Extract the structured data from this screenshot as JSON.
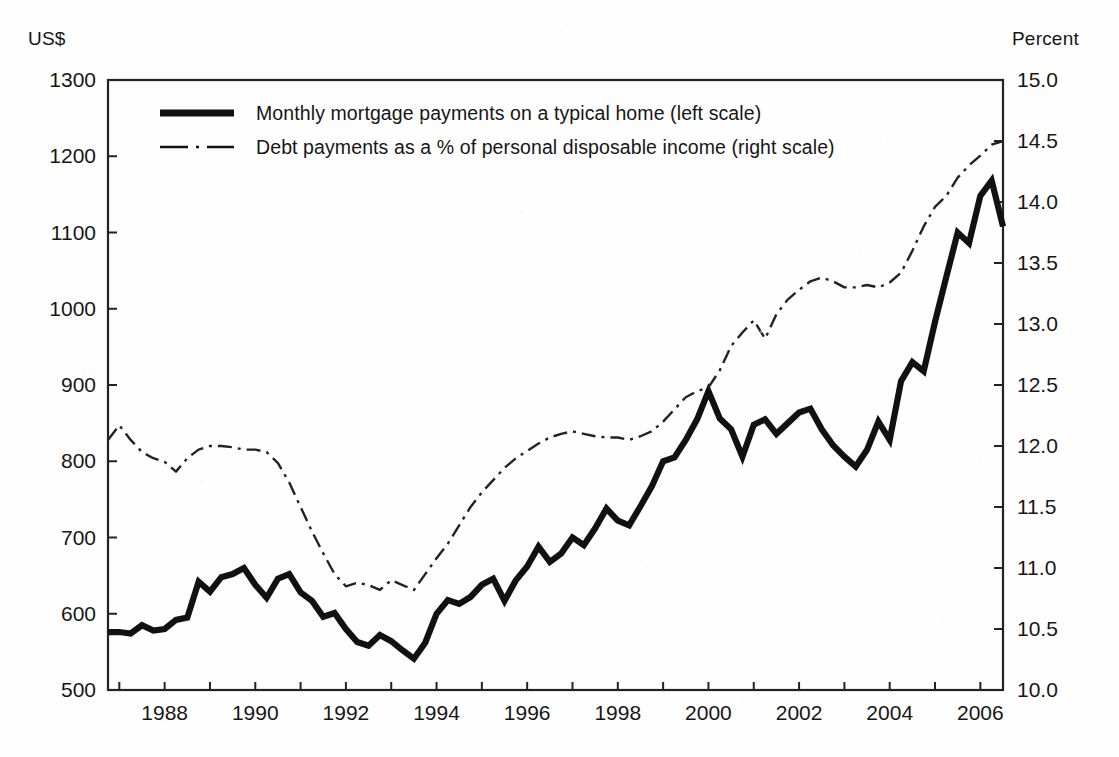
{
  "figure": {
    "background_color": "#fefefe",
    "ink_color": "#161616",
    "plot_box": {
      "left": 108,
      "top": 80,
      "right": 1003,
      "bottom": 690
    }
  },
  "left_axis": {
    "title": "US$",
    "ticks": [
      1300,
      1200,
      1100,
      1000,
      900,
      800,
      700,
      600,
      500
    ],
    "min": 500,
    "max": 1300
  },
  "right_axis": {
    "title": "Percent",
    "ticks": [
      "15.0",
      "14.5",
      "14.0",
      "13.5",
      "13.0",
      "12.5",
      "12.0",
      "11.5",
      "11.0",
      "10.5",
      "10.0"
    ],
    "min": 10.0,
    "max": 15.0
  },
  "x_axis": {
    "tick_labels": [
      "1988",
      "1990",
      "1992",
      "1994",
      "1996",
      "1998",
      "2000",
      "2002",
      "2004",
      "2006"
    ],
    "min": 1986.75,
    "max": 2006.5,
    "minor_tick_interval": 1
  },
  "legend": {
    "items": [
      {
        "label": "Monthly mortgage payments on a typical home (left scale)",
        "style": "solid-thick",
        "series": "mortgage_payments"
      },
      {
        "label": "Debt payments as a % of personal disposable income (right scale)",
        "style": "dash-dot-thin",
        "series": "debt_service_ratio"
      }
    ]
  },
  "chart_data": {
    "type": "line",
    "title": "",
    "xlabel": "",
    "ylabel": "US$",
    "y2label": "Percent",
    "xlim": [
      1986.75,
      2006.5
    ],
    "ylim": [
      500,
      1300
    ],
    "y2lim": [
      10.0,
      15.0
    ],
    "grid": false,
    "legend_position": "top-left inside plot",
    "series": [
      {
        "name": "Monthly mortgage payments on a typical home (left scale)",
        "axis": "left",
        "unit": "US$",
        "style": "solid-thick",
        "x": [
          1986.75,
          1987.0,
          1987.25,
          1987.5,
          1987.75,
          1988.0,
          1988.25,
          1988.5,
          1988.75,
          1989.0,
          1989.25,
          1989.5,
          1989.75,
          1990.0,
          1990.25,
          1990.5,
          1990.75,
          1991.0,
          1991.25,
          1991.5,
          1991.75,
          1992.0,
          1992.25,
          1992.5,
          1992.75,
          1993.0,
          1993.25,
          1993.5,
          1993.75,
          1994.0,
          1994.25,
          1994.5,
          1994.75,
          1995.0,
          1995.25,
          1995.5,
          1995.75,
          1996.0,
          1996.25,
          1996.5,
          1996.75,
          1997.0,
          1997.25,
          1997.5,
          1997.75,
          1998.0,
          1998.25,
          1998.5,
          1998.75,
          1999.0,
          1999.25,
          1999.5,
          1999.75,
          2000.0,
          2000.25,
          2000.5,
          2000.75,
          2001.0,
          2001.25,
          2001.5,
          2001.75,
          2002.0,
          2002.25,
          2002.5,
          2002.75,
          2003.0,
          2003.25,
          2003.5,
          2003.75,
          2004.0,
          2004.25,
          2004.5,
          2004.75,
          2005.0,
          2005.25,
          2005.5,
          2005.75,
          2006.0,
          2006.25,
          2006.5
        ],
        "values": [
          576,
          576,
          574,
          585,
          578,
          580,
          592,
          595,
          642,
          629,
          648,
          652,
          660,
          638,
          621,
          646,
          652,
          628,
          617,
          596,
          601,
          580,
          563,
          558,
          572,
          564,
          552,
          541,
          562,
          600,
          618,
          613,
          622,
          638,
          646,
          617,
          644,
          662,
          688,
          668,
          679,
          700,
          690,
          712,
          738,
          722,
          716,
          741,
          767,
          800,
          805,
          828,
          855,
          892,
          856,
          842,
          806,
          848,
          855,
          836,
          850,
          864,
          869,
          842,
          821,
          806,
          793,
          815,
          852,
          828,
          905,
          930,
          918,
          983,
          1042,
          1100,
          1086,
          1148,
          1168,
          1108
        ]
      },
      {
        "name": "Debt payments as a % of personal disposable income (right scale)",
        "axis": "right",
        "unit": "percent",
        "style": "dash-dot-thin",
        "x": [
          1986.75,
          1987.0,
          1987.25,
          1987.5,
          1987.75,
          1988.0,
          1988.25,
          1988.5,
          1988.75,
          1989.0,
          1989.25,
          1989.5,
          1989.75,
          1990.0,
          1990.25,
          1990.5,
          1990.75,
          1991.0,
          1991.25,
          1991.5,
          1991.75,
          1992.0,
          1992.25,
          1992.5,
          1992.75,
          1993.0,
          1993.25,
          1993.5,
          1993.75,
          1994.0,
          1994.25,
          1994.5,
          1994.75,
          1995.0,
          1995.25,
          1995.5,
          1995.75,
          1996.0,
          1996.25,
          1996.5,
          1996.75,
          1997.0,
          1997.25,
          1997.5,
          1997.75,
          1998.0,
          1998.25,
          1998.5,
          1998.75,
          1999.0,
          1999.25,
          1999.5,
          1999.75,
          2000.0,
          2000.25,
          2000.5,
          2000.75,
          2001.0,
          2001.25,
          2001.5,
          2001.75,
          2002.0,
          2002.25,
          2002.5,
          2002.75,
          2003.0,
          2003.25,
          2003.5,
          2003.75,
          2004.0,
          2004.25,
          2004.5,
          2004.75,
          2005.0,
          2005.25,
          2005.5,
          2005.75,
          2006.0,
          2006.25,
          2006.5
        ],
        "values": [
          12.05,
          12.17,
          12.05,
          11.95,
          11.9,
          11.87,
          11.79,
          11.9,
          11.97,
          12.0,
          12.0,
          11.99,
          11.97,
          11.97,
          11.95,
          11.86,
          11.7,
          11.5,
          11.3,
          11.12,
          10.95,
          10.85,
          10.88,
          10.86,
          10.82,
          10.9,
          10.86,
          10.82,
          10.95,
          11.08,
          11.2,
          11.35,
          11.5,
          11.62,
          11.72,
          11.82,
          11.9,
          11.96,
          12.02,
          12.07,
          12.1,
          12.12,
          12.1,
          12.08,
          12.07,
          12.07,
          12.05,
          12.08,
          12.12,
          12.2,
          12.3,
          12.4,
          12.45,
          12.48,
          12.62,
          12.82,
          12.93,
          13.03,
          12.88,
          13.08,
          13.2,
          13.28,
          13.35,
          13.38,
          13.35,
          13.3,
          13.3,
          13.32,
          13.3,
          13.34,
          13.42,
          13.6,
          13.8,
          13.96,
          14.05,
          14.2,
          14.3,
          14.38,
          14.47,
          14.5
        ]
      }
    ]
  }
}
